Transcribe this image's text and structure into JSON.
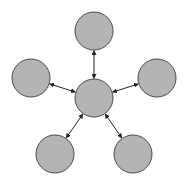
{
  "diagram": {
    "type": "hub-and-spoke",
    "colors": {
      "background": "#ffffff",
      "node_fill": "#b4b4b4",
      "node_stroke": "#4a4a4a",
      "edge_stroke": "#222222"
    },
    "node_radius": 19,
    "nodes": [
      {
        "id": "center",
        "cx": 94,
        "cy": 98
      },
      {
        "id": "top",
        "cx": 94,
        "cy": 31
      },
      {
        "id": "left",
        "cx": 31,
        "cy": 78
      },
      {
        "id": "right",
        "cx": 157,
        "cy": 78
      },
      {
        "id": "bottom-left",
        "cx": 55,
        "cy": 154
      },
      {
        "id": "bottom-right",
        "cx": 133,
        "cy": 154
      }
    ],
    "edges": [
      {
        "from": "center",
        "to": "top",
        "direction": "bidirectional"
      },
      {
        "from": "center",
        "to": "left",
        "direction": "bidirectional"
      },
      {
        "from": "center",
        "to": "right",
        "direction": "bidirectional"
      },
      {
        "from": "center",
        "to": "bottom-left",
        "direction": "bidirectional"
      },
      {
        "from": "center",
        "to": "bottom-right",
        "direction": "bidirectional"
      }
    ]
  }
}
